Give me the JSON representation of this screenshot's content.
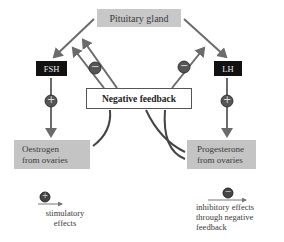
{
  "diagram": {
    "nodes": {
      "pituitary": "Pituitary gland",
      "fsh": "FSH",
      "lh": "LH",
      "negative_feedback": "Negative feedback",
      "oestrogen_line1": "Oestrogen",
      "oestrogen_line2": "from ovaries",
      "progesterone_line1": "Progesterone",
      "progesterone_line2": "from ovaries"
    },
    "symbols": {
      "plus": "+",
      "minus": "−"
    },
    "legend": {
      "stimulatory_line1": "stimulatory",
      "stimulatory_line2": "effects",
      "inhibitory_line1": "inhibitory effects",
      "inhibitory_line2": "through negative",
      "inhibitory_line3": "feedback"
    },
    "colors": {
      "arrow": "#6b6b6b",
      "grey_box": "#c4c4c4",
      "black_box": "#111111",
      "curve": "#444444"
    }
  }
}
